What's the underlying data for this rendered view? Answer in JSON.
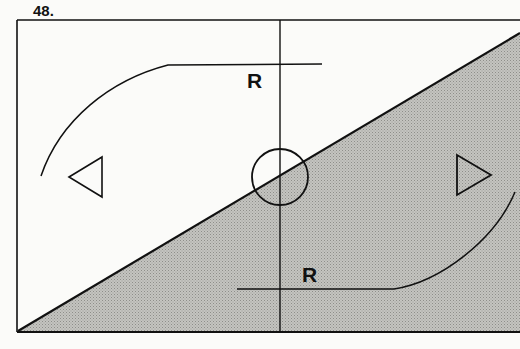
{
  "figure": {
    "number": "48.",
    "labels": {
      "top_r": "R",
      "bottom_r": "R"
    },
    "colors": {
      "line": "#111111",
      "shade": "#b9b9b6",
      "background": "#fbfbf9"
    },
    "shapes": [
      "frame-rectangle",
      "diagonal-shaded-triangle",
      "vertical-center-line",
      "center-circle",
      "left-triangle-pointing-left",
      "right-triangle-pointing-right",
      "top-arc-with-horizontal-line",
      "bottom-arc-with-horizontal-line"
    ]
  }
}
